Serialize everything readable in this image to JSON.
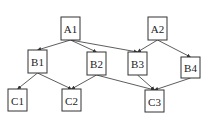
{
  "diagram": {
    "type": "directed-hierarchy",
    "nodes": [
      {
        "id": "A1",
        "label": "A1",
        "x": 61,
        "y": 17,
        "w": 19,
        "h": 23
      },
      {
        "id": "A2",
        "label": "A2",
        "x": 148,
        "y": 17,
        "w": 19,
        "h": 23
      },
      {
        "id": "B1",
        "label": "B1",
        "x": 28,
        "y": 50,
        "w": 19,
        "h": 23
      },
      {
        "id": "B2",
        "label": "B2",
        "x": 87,
        "y": 52,
        "w": 19,
        "h": 23
      },
      {
        "id": "B3",
        "label": "B3",
        "x": 128,
        "y": 52,
        "w": 19,
        "h": 23
      },
      {
        "id": "B4",
        "label": "B4",
        "x": 181,
        "y": 57,
        "w": 19,
        "h": 21
      },
      {
        "id": "C1",
        "label": "C1",
        "x": 8,
        "y": 89,
        "w": 19,
        "h": 22
      },
      {
        "id": "C2",
        "label": "C2",
        "x": 62,
        "y": 89,
        "w": 19,
        "h": 22
      },
      {
        "id": "C3",
        "label": "C3",
        "x": 145,
        "y": 90,
        "w": 19,
        "h": 22
      }
    ],
    "edges": [
      {
        "from": "A1",
        "to": "B1"
      },
      {
        "from": "A1",
        "to": "B2"
      },
      {
        "from": "A1",
        "to": "B3"
      },
      {
        "from": "A2",
        "to": "B3"
      },
      {
        "from": "A2",
        "to": "B4"
      },
      {
        "from": "B1",
        "to": "C1"
      },
      {
        "from": "B1",
        "to": "C2"
      },
      {
        "from": "B2",
        "to": "C2"
      },
      {
        "from": "B2",
        "to": "C3"
      },
      {
        "from": "B3",
        "to": "C3"
      },
      {
        "from": "B4",
        "to": "C3"
      }
    ]
  }
}
